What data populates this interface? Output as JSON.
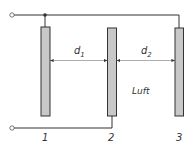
{
  "diagram": {
    "plates": [
      {
        "id": "plate-1",
        "label": "1"
      },
      {
        "id": "plate-2",
        "label": "2"
      },
      {
        "id": "plate-3",
        "label": "3"
      }
    ],
    "distances": [
      {
        "symbol": "d",
        "subscript": "1"
      },
      {
        "symbol": "d",
        "subscript": "2"
      }
    ],
    "medium_label": "Luft",
    "colors": {
      "plate_fill": "#c8c8c8",
      "stroke": "#333333"
    }
  }
}
